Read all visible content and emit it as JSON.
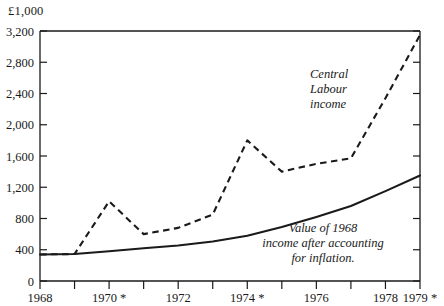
{
  "chart_data": {
    "type": "line",
    "title": "",
    "unit_label": "£1,000",
    "xlabel": "",
    "ylabel": "",
    "x": [
      1968,
      1969,
      1970,
      1971,
      1972,
      1973,
      1974,
      1975,
      1976,
      1977,
      1978,
      1979
    ],
    "xlim": [
      1968,
      1979
    ],
    "ylim": [
      0,
      3200
    ],
    "ytick_values": [
      0,
      400,
      800,
      1200,
      1600,
      2000,
      2400,
      2800,
      3200
    ],
    "ytick_labels": [
      "0",
      "400",
      "800",
      "1,200",
      "1,600",
      "2,000",
      "2,400",
      "2,800",
      "3,200"
    ],
    "xtick_values": [
      1968,
      1969,
      1970,
      1971,
      1972,
      1973,
      1974,
      1975,
      1976,
      1977,
      1978,
      1979
    ],
    "xtick_labels": [
      "1968",
      "",
      "1970 *",
      "",
      "1972",
      "",
      "1974 *",
      "",
      "1976",
      "",
      "1978",
      "1979 *"
    ],
    "grid": false,
    "legend": "annotations",
    "series": [
      {
        "name": "Central Labour income",
        "style": "dashed",
        "values": [
          340,
          345,
          1020,
          600,
          680,
          850,
          1800,
          1400,
          1500,
          1570,
          2340,
          3150
        ]
      },
      {
        "name": "Value of 1968 income after accounting for inflation.",
        "style": "solid",
        "values": [
          340,
          345,
          380,
          420,
          455,
          505,
          580,
          690,
          820,
          960,
          1150,
          1350
        ]
      }
    ],
    "annotations": [
      {
        "id": "central-labour-income",
        "lines": [
          "Central",
          "Labour",
          "income"
        ],
        "align": "left",
        "x_px": 310,
        "y_px": 78
      },
      {
        "id": "value-of-1968-income",
        "lines": [
          "Value of 1968",
          "income after accounting",
          "for inflation."
        ],
        "align": "center",
        "x_px": 323,
        "y_px": 232
      }
    ]
  }
}
